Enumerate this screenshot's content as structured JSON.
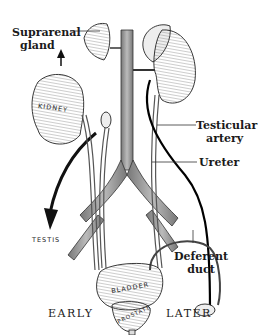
{
  "diagram": {
    "labels": {
      "suprarenal_gland": "Suprarenal\ngland",
      "suprarenal_line1": "Suprarenal",
      "suprarenal_line2": "gland",
      "kidney": "KIDNEY",
      "testicular_artery_line1": "Testicular",
      "testicular_artery_line2": "artery",
      "ureter": "Ureter",
      "testis": "TESTIS",
      "deferent_duct_line1": "Deferent",
      "deferent_duct_line2": "duct",
      "bladder": "BLADDER",
      "prostate": "PROSTATE"
    },
    "captions": {
      "early": "EARLY",
      "later": "LATER"
    },
    "colors": {
      "ink": "#1a1a1a",
      "vessel_shade": "#9a9a9a",
      "organ_fill": "#f2f2f2",
      "background": "#ffffff"
    }
  }
}
